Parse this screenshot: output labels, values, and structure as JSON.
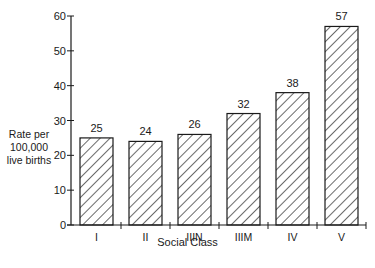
{
  "chart_data": {
    "type": "bar",
    "title": "",
    "xlabel": "Social Class",
    "ylabel": "Rate per 100,000 live births",
    "ylabel_lines": [
      "Rate per",
      "100,000",
      "live births"
    ],
    "categories": [
      "I",
      "II",
      "IIIN",
      "IIIM",
      "IV",
      "V"
    ],
    "values": [
      25,
      24,
      26,
      32,
      38,
      57
    ],
    "data_labels": [
      "25",
      "24",
      "26",
      "32",
      "38",
      "57"
    ],
    "ylim": [
      0,
      60
    ],
    "yticks": [
      0,
      10,
      20,
      30,
      40,
      50,
      60
    ],
    "grid": false,
    "legend": null,
    "bar_fill": "diagonal hatch",
    "colors": {
      "ink": "#1a1a1a",
      "background": "#ffffff"
    }
  }
}
